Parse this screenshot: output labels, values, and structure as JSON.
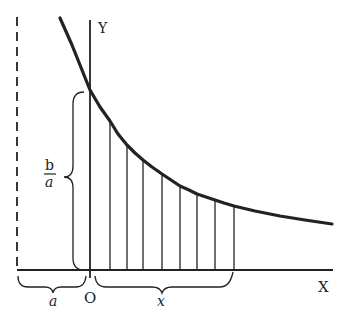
{
  "diagram": {
    "type": "hyperbola-area-figure",
    "colors": {
      "ink": "#222222",
      "background": "#ffffff"
    },
    "axes": {
      "x_label": "X",
      "y_label": "Y",
      "origin_label": "O"
    },
    "braces": {
      "left_offset_label": "a",
      "interval_label": "x",
      "height_label_num": "b",
      "height_label_den": "a"
    },
    "asymptote": {
      "style": "dashed",
      "position_label": "a"
    },
    "curve": {
      "description": "decreasing hyperbolic curve crossing Y axis at height b/a",
      "points": [
        [
          60,
          18
        ],
        [
          72,
          45
        ],
        [
          82,
          70
        ],
        [
          90,
          90
        ],
        [
          100,
          107
        ],
        [
          110,
          121
        ],
        [
          118,
          134
        ],
        [
          127,
          145
        ],
        [
          135,
          153
        ],
        [
          143,
          160
        ],
        [
          152,
          167
        ],
        [
          162,
          174
        ],
        [
          171,
          180
        ],
        [
          180,
          186
        ],
        [
          189,
          190
        ],
        [
          197,
          194
        ],
        [
          206,
          197
        ],
        [
          215,
          200
        ],
        [
          224,
          203
        ],
        [
          234,
          206
        ],
        [
          255,
          211
        ],
        [
          280,
          216
        ],
        [
          305,
          220
        ],
        [
          332,
          224
        ]
      ]
    },
    "hatch_lines_x": [
      110,
      127,
      143,
      162,
      180,
      197,
      215,
      234
    ],
    "hatch_tops_y": [
      121,
      145,
      160,
      174,
      186,
      194,
      200,
      206
    ]
  }
}
